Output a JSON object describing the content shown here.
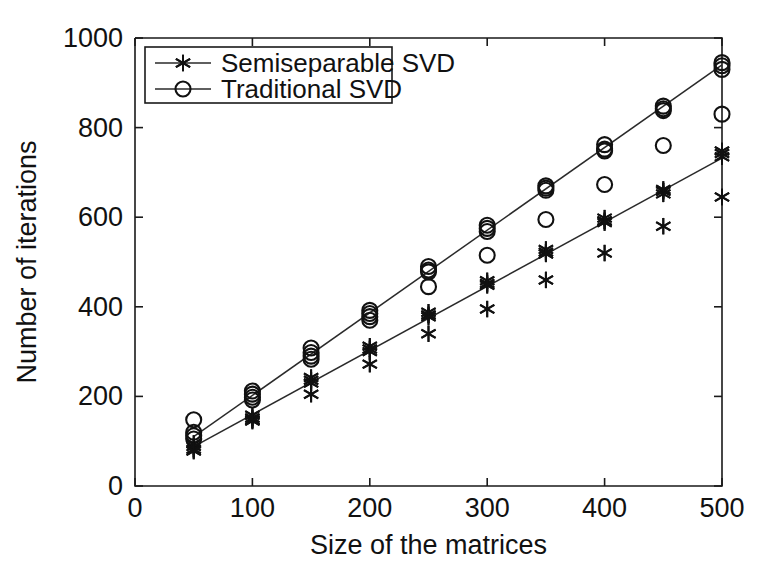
{
  "chart_data": {
    "type": "scatter",
    "title": "",
    "xlabel": "Size of the matrices",
    "ylabel": "Number of iterations",
    "xlim": [
      0,
      500
    ],
    "ylim": [
      0,
      1000
    ],
    "xticks": [
      0,
      100,
      200,
      300,
      400,
      500
    ],
    "yticks": [
      0,
      200,
      400,
      600,
      800,
      1000
    ],
    "xtick_labels": [
      "0",
      "100",
      "200",
      "300",
      "400",
      "500"
    ],
    "ytick_labels": [
      "0",
      "200",
      "400",
      "600",
      "800",
      "1000"
    ],
    "grid": false,
    "legend_position": "upper left",
    "legend_entries": [
      {
        "label": "Semiseparable SVD",
        "marker": "star",
        "marker_name": "asterisk-marker"
      },
      {
        "label": "Traditional SVD",
        "marker": "circle",
        "marker_name": "circle-marker"
      }
    ],
    "series": [
      {
        "name": "Traditional SVD",
        "marker": "circle",
        "x": [
          50,
          50,
          50,
          50,
          100,
          100,
          100,
          100,
          150,
          150,
          150,
          150,
          200,
          200,
          200,
          200,
          250,
          250,
          250,
          250,
          300,
          300,
          300,
          300,
          350,
          350,
          350,
          350,
          400,
          400,
          400,
          400,
          450,
          450,
          450,
          450,
          500,
          500,
          500,
          500
        ],
        "y": [
          148,
          120,
          112,
          105,
          212,
          205,
          198,
          192,
          308,
          298,
          290,
          283,
          392,
          385,
          378,
          370,
          490,
          482,
          478,
          445,
          582,
          575,
          568,
          515,
          670,
          665,
          660,
          595,
          762,
          752,
          748,
          673,
          848,
          842,
          838,
          760,
          945,
          938,
          930,
          830
        ],
        "fit_line": {
          "x": [
            50,
            500
          ],
          "y": [
            110,
            940
          ]
        }
      },
      {
        "name": "Semiseparable SVD",
        "marker": "star",
        "x": [
          50,
          50,
          50,
          50,
          100,
          100,
          100,
          100,
          150,
          150,
          150,
          150,
          200,
          200,
          200,
          200,
          250,
          250,
          250,
          250,
          300,
          300,
          300,
          300,
          350,
          350,
          350,
          350,
          400,
          400,
          400,
          400,
          450,
          450,
          450,
          450,
          500,
          500,
          500,
          500
        ],
        "y": [
          95,
          88,
          82,
          78,
          158,
          152,
          148,
          145,
          242,
          236,
          230,
          205,
          312,
          306,
          300,
          272,
          388,
          382,
          378,
          340,
          458,
          452,
          448,
          395,
          528,
          522,
          518,
          460,
          598,
          592,
          588,
          520,
          662,
          658,
          652,
          580,
          748,
          742,
          735,
          645
        ],
        "fit_line": {
          "x": [
            50,
            500
          ],
          "y": [
            88,
            732
          ]
        }
      }
    ]
  },
  "axes_geometry": {
    "plot_left_px": 135,
    "plot_right_px": 722,
    "plot_top_px": 38,
    "plot_bottom_px": 486
  }
}
